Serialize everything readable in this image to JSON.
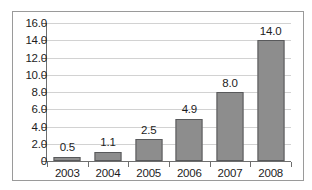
{
  "figure": {
    "border_color": "#9a9a9a",
    "background": "#ffffff"
  },
  "chart_data": {
    "type": "bar",
    "title": "",
    "subtitle": "",
    "xlabel": "",
    "ylabel": "",
    "categories": [
      "2003",
      "2004",
      "2005",
      "2006",
      "2007",
      "2008"
    ],
    "values": [
      0.5,
      1.1,
      2.5,
      4.9,
      8.0,
      14.0
    ],
    "data_labels": [
      "0.5",
      "1.1",
      "2.5",
      "4.9",
      "8.0",
      "14.0"
    ],
    "ylim": [
      0,
      16
    ],
    "ytick_values": [
      0,
      2,
      4,
      6,
      8,
      10,
      12,
      14,
      16
    ],
    "ytick_labels": [
      "0",
      "2.0",
      "4.0",
      "6.0",
      "8.0",
      "10.0",
      "12.0",
      "14.0",
      "16.0"
    ],
    "grid": true,
    "grid_axis": "y",
    "legend": false,
    "legend_position": "none",
    "bar_color": "#8d8d8d",
    "bar_border_color": "#58595b",
    "gridline_color": "#d2d2d2",
    "axis_color": "#6e6e6e",
    "text_color": "#1d1d1d",
    "plot_background": "#ffffff"
  }
}
